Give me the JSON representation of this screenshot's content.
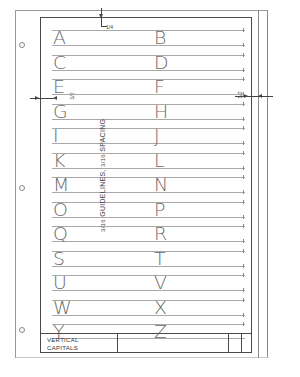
{
  "sheet": {
    "title_block": {
      "line1": "VERTICAL",
      "line2": "CAPITALS"
    },
    "annotation": {
      "frac_a": "3/16",
      "guidelines": "GUIDELINES,",
      "frac_b": "3/16",
      "spacing": "SPACING"
    },
    "dimensions": {
      "top_margin": "1/4",
      "left_margin": "1/2",
      "right_margin": "1/2"
    },
    "rows": [
      {
        "left": "A",
        "right": "B"
      },
      {
        "left": "C",
        "right": "D"
      },
      {
        "left": "E",
        "right": "F"
      },
      {
        "left": "G",
        "right": "H"
      },
      {
        "left": "I",
        "right": "J"
      },
      {
        "left": "K",
        "right": "L"
      },
      {
        "left": "M",
        "right": "N"
      },
      {
        "left": "O",
        "right": "P"
      },
      {
        "left": "Q",
        "right": "R"
      },
      {
        "left": "S",
        "right": "T"
      },
      {
        "left": "U",
        "right": "V"
      },
      {
        "left": "W",
        "right": "X"
      },
      {
        "left": "Y",
        "right": "Z"
      }
    ],
    "colors": {
      "frame": "#4a4a4a",
      "guideline": "#a8a8a8",
      "letter": "#6a6a6a",
      "page_border": "#9a9a9a"
    }
  }
}
